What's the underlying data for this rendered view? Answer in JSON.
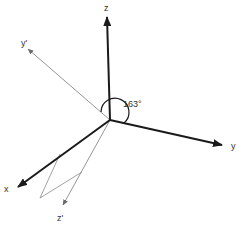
{
  "diagram": {
    "type": "coordinate-axes-3d",
    "origin": [
      110,
      120
    ],
    "angle_label": "163°",
    "axes": [
      {
        "id": "z",
        "label": "z",
        "style": "thick",
        "end": [
          107,
          16
        ],
        "label_pos": [
          104,
          11
        ]
      },
      {
        "id": "y",
        "label": "y",
        "style": "thick",
        "end": [
          222,
          145
        ],
        "label_pos": [
          232,
          149
        ]
      },
      {
        "id": "x",
        "label": "x",
        "style": "thick",
        "end": [
          18,
          187
        ],
        "label_pos": [
          5,
          191
        ]
      },
      {
        "id": "yp",
        "label": "y'",
        "style": "thin",
        "end": [
          28,
          49
        ],
        "label_pos": [
          22,
          46
        ]
      },
      {
        "id": "zp",
        "label": "z'",
        "style": "thin",
        "end": [
          63,
          205
        ],
        "label_pos": [
          57,
          221
        ]
      }
    ],
    "construction_lines": [
      [
        [
          60,
          154
        ],
        [
          40,
          198
        ]
      ],
      [
        [
          40,
          198
        ],
        [
          82,
          172
        ]
      ]
    ],
    "colors": {
      "thick_axis": "#1a1a1a",
      "thin_axis": "#8a8a8a",
      "label": "#333333"
    }
  }
}
